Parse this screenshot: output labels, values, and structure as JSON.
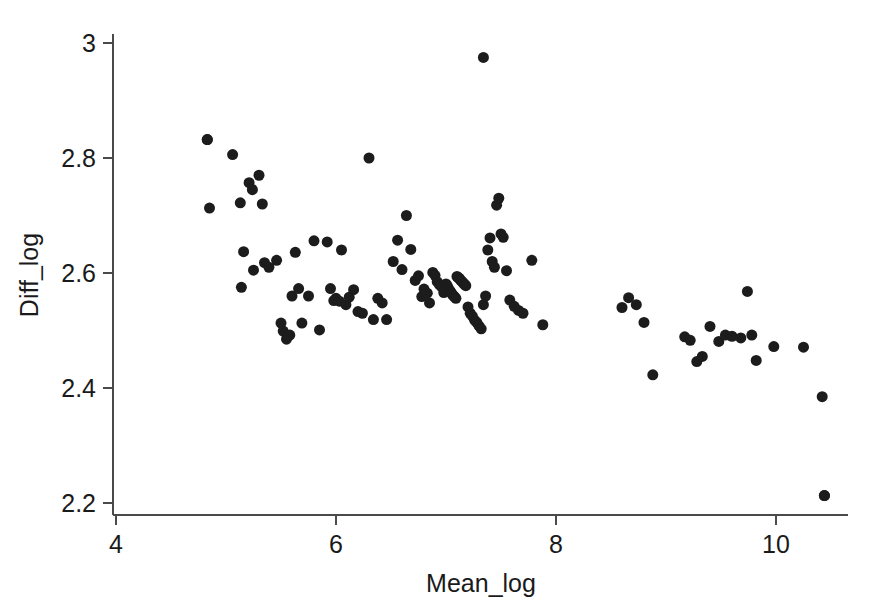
{
  "chart_data": {
    "type": "scatter",
    "title": "",
    "subtitle": "",
    "xlabel": "Mean_log",
    "ylabel": "Diff_log",
    "xlim": [
      3.8,
      10.65
    ],
    "ylim": [
      2.155,
      3.04
    ],
    "xticks": [
      4,
      6,
      8,
      10
    ],
    "xtick_labels": [
      "4",
      "6",
      "8",
      "10"
    ],
    "yticks": [
      2.2,
      2.4,
      2.6,
      2.8,
      3.0
    ],
    "ytick_labels": [
      "2.2",
      "2.4",
      "2.6",
      "2.8",
      "3"
    ],
    "grid": false,
    "legend": null,
    "marker": "filled-circle",
    "marker_color": "#1c1c1c",
    "marker_size_px": 11,
    "n_points": 120,
    "x": [
      4.83,
      4.85,
      5.06,
      5.13,
      5.14,
      5.16,
      5.21,
      5.24,
      5.25,
      5.3,
      5.33,
      5.35,
      5.39,
      5.46,
      5.5,
      5.52,
      5.55,
      5.58,
      5.6,
      5.63,
      5.66,
      5.69,
      5.75,
      5.8,
      5.85,
      5.92,
      5.95,
      5.98,
      6.0,
      6.03,
      6.05,
      6.09,
      6.12,
      6.16,
      6.2,
      6.24,
      6.3,
      6.34,
      6.38,
      6.42,
      6.46,
      6.52,
      6.56,
      6.6,
      6.64,
      6.68,
      6.72,
      6.75,
      6.78,
      6.8,
      6.83,
      6.85,
      6.88,
      6.9,
      6.92,
      6.94,
      6.96,
      6.98,
      7.0,
      7.01,
      7.02,
      7.03,
      7.04,
      7.05,
      7.06,
      7.07,
      7.08,
      7.09,
      7.1,
      7.11,
      7.12,
      7.13,
      7.14,
      7.15,
      7.16,
      7.17,
      7.18,
      7.2,
      7.22,
      7.24,
      7.26,
      7.28,
      7.3,
      7.32,
      7.34,
      7.36,
      7.38,
      7.4,
      7.42,
      7.44,
      7.46,
      7.48,
      7.5,
      7.52,
      7.55,
      7.58,
      7.62,
      7.66,
      7.7,
      7.78,
      7.88,
      8.6,
      8.66,
      8.73,
      8.8,
      8.88,
      9.17,
      9.22,
      9.28,
      9.33,
      9.4,
      9.48,
      9.54,
      9.6,
      9.68,
      9.74,
      9.78,
      9.82,
      9.98,
      10.25,
      10.42,
      10.44
    ],
    "y": [
      2.832,
      2.713,
      2.806,
      2.722,
      2.575,
      2.637,
      2.757,
      2.745,
      2.605,
      2.77,
      2.72,
      2.618,
      2.61,
      2.622,
      2.513,
      2.499,
      2.485,
      2.492,
      2.56,
      2.636,
      2.573,
      2.513,
      2.56,
      2.656,
      2.501,
      2.654,
      2.573,
      2.552,
      2.556,
      2.551,
      2.64,
      2.545,
      2.558,
      2.571,
      2.533,
      2.53,
      2.8,
      2.519,
      2.556,
      2.548,
      2.519,
      2.62,
      2.657,
      2.606,
      2.7,
      2.641,
      2.587,
      2.595,
      2.559,
      2.572,
      2.565,
      2.548,
      2.601,
      2.596,
      2.585,
      2.58,
      2.576,
      2.566,
      2.581,
      2.578,
      2.574,
      2.57,
      2.568,
      2.565,
      2.562,
      2.56,
      2.558,
      2.556,
      2.594,
      2.592,
      2.591,
      2.588,
      2.586,
      2.584,
      2.582,
      2.58,
      2.578,
      2.541,
      2.53,
      2.525,
      2.518,
      2.514,
      2.508,
      2.503,
      2.545,
      2.56,
      2.64,
      2.661,
      2.62,
      2.61,
      2.718,
      2.73,
      2.668,
      2.662,
      2.604,
      2.553,
      2.542,
      2.535,
      2.53,
      2.622,
      2.51,
      2.54,
      2.557,
      2.545,
      2.514,
      2.423,
      2.489,
      2.483,
      2.446,
      2.455,
      2.507,
      2.481,
      2.492,
      2.49,
      2.487,
      2.568,
      2.492,
      2.448,
      2.472,
      2.471,
      2.385,
      2.213
    ],
    "extra_points": {
      "top_outlier": {
        "x": 7.34,
        "y": 2.975
      },
      "high_left": {
        "x": 4.83,
        "y": 2.832
      },
      "low_right": {
        "x": 10.44,
        "y": 2.213
      }
    }
  },
  "axes": {
    "x_axis_name": "Mean_log",
    "y_axis_name": "Diff_log"
  },
  "colors": {
    "marker": "#1c1c1c",
    "axis": "#4a4a4a",
    "text": "#1a1a1a",
    "background": "#ffffff"
  }
}
